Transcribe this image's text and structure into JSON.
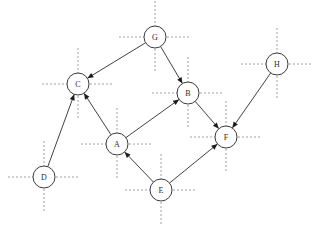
{
  "diagram": {
    "type": "directed-graph",
    "background_color": "#ffffff",
    "node_fill_color": "#ffffff",
    "node_stroke_color": "#3b3b3b",
    "edge_color": "#2b2b2b",
    "crosshair_color": "#8a8a8a",
    "label_color": "#2b2b2b",
    "node_radius": 11,
    "crosshair_arm_length": 25,
    "nodes": [
      {
        "id": "A",
        "label": "A",
        "x": 117,
        "y": 144
      },
      {
        "id": "B",
        "label": "B",
        "x": 188,
        "y": 93
      },
      {
        "id": "C",
        "label": "C",
        "x": 78,
        "y": 84
      },
      {
        "id": "D",
        "label": "D",
        "x": 44,
        "y": 177
      },
      {
        "id": "E",
        "label": "E",
        "x": 161,
        "y": 190
      },
      {
        "id": "F",
        "label": "F",
        "x": 226,
        "y": 137
      },
      {
        "id": "G",
        "label": "G",
        "x": 155,
        "y": 37
      },
      {
        "id": "H",
        "label": "H",
        "x": 277,
        "y": 64
      }
    ],
    "edges": [
      {
        "from": "G",
        "to": "C",
        "directed": true
      },
      {
        "from": "G",
        "to": "B",
        "directed": true
      },
      {
        "from": "D",
        "to": "C",
        "directed": true
      },
      {
        "from": "A",
        "to": "C",
        "directed": true
      },
      {
        "from": "A",
        "to": "B",
        "directed": true
      },
      {
        "from": "B",
        "to": "F",
        "directed": true
      },
      {
        "from": "H",
        "to": "F",
        "directed": true
      },
      {
        "from": "E",
        "to": "A",
        "directed": true
      },
      {
        "from": "E",
        "to": "F",
        "directed": true
      }
    ]
  }
}
